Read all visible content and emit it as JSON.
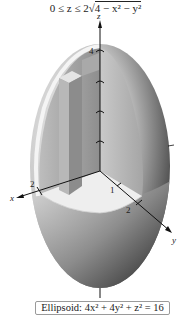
{
  "title": {
    "prefix": "0 ≤ z ≤ 2",
    "radicand": "4 − x² − y²",
    "full": "0 ≤ z ≤ 2√(4 − x² − y²)"
  },
  "axes": {
    "z_label": "z",
    "x_label": "x",
    "y_label": "y",
    "z_tick_label": "4",
    "x_tick_label": "2",
    "y_tick_labels": [
      "1",
      "2"
    ]
  },
  "caption": {
    "text": "Ellipsoid: 4x² + 4y² + z² = 16"
  },
  "colors": {
    "ellipsoid_light": "#e6e6e6",
    "ellipsoid_dark": "#1e1e1e",
    "cutout_wall": "#9c9c9c",
    "column_front": "#b4b4b4",
    "column_side": "#8a8a8a",
    "floor": "#ececec",
    "axis": "#111111"
  }
}
